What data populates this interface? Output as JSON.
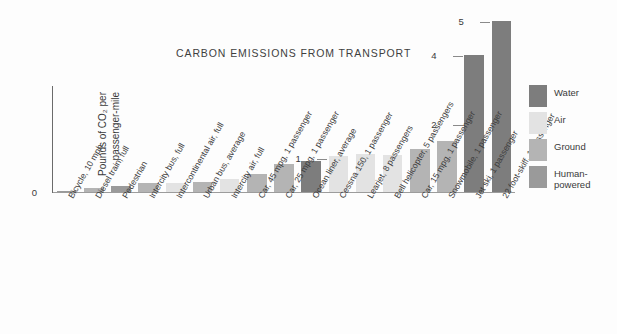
{
  "chart_data": {
    "type": "bar",
    "title": "CARBON EMISSIONS FROM TRANSPORT",
    "xlabel": "",
    "ylabel": "Pounds of CO₂ per passenger-mile",
    "ylabel_line1": "Pounds of CO₂ per",
    "ylabel_line2": "passenger-mile",
    "ylim": [
      0,
      5.3
    ],
    "grid": false,
    "yticks": [
      0,
      1,
      2,
      4,
      5
    ],
    "ytick_labels": [
      "0",
      "1",
      "2",
      "4",
      "5"
    ],
    "legend_position": "right",
    "categories": [
      "Bicycle, 10 mph",
      "Diesel train, full",
      "Pedestrian",
      "Intercity bus, full",
      "Intercontinental air, full",
      "Urban bus, average",
      "Intercity air, full",
      "Car, 45 mpg, 1 passenger",
      "Car, 25 mpg, 1 passenger",
      "Ocean liner, average",
      "Cessna 150, 1 passenger",
      "Learjet, 8 passengers",
      "Bell helicopter, 5 passengers",
      "Car, 15 mpg, 1 passenger",
      "Snowmobile, 1 passenger",
      "Jet ski, 1 passenger",
      "22 foot-skiff, 1 passenger"
    ],
    "values": [
      0.03,
      0.13,
      0.17,
      0.26,
      0.26,
      0.28,
      0.38,
      0.52,
      0.83,
      0.92,
      1.05,
      1.12,
      1.08,
      1.25,
      1.48,
      4.0,
      5.0
    ],
    "groups": [
      "Human-powered",
      "Ground",
      "Human-powered",
      "Ground",
      "Air",
      "Ground",
      "Air",
      "Ground",
      "Ground",
      "Water",
      "Air",
      "Air",
      "Air",
      "Ground",
      "Ground",
      "Water",
      "Water"
    ]
  },
  "legend": {
    "items": [
      {
        "label": "Water",
        "color": "#7d7d7d"
      },
      {
        "label": "Air",
        "color": "#e3e3e3"
      },
      {
        "label": "Ground",
        "color": "#b4b4b4"
      },
      {
        "label": "Human-powered",
        "color": "#9a9a9a"
      }
    ]
  },
  "colors": {
    "Water": "#7d7d7d",
    "Air": "#e3e3e3",
    "Ground": "#b4b4b4",
    "Human-powered": "#9a9a9a",
    "axis": "#6b6b6b",
    "text": "#3a3a3a",
    "background": "#fdfdfd"
  }
}
